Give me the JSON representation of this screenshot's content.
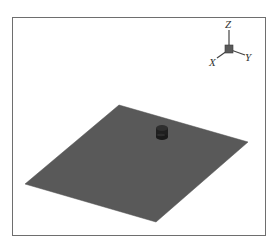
{
  "viewport": {
    "background": "#ffffff",
    "border_color": "#6e6e6e"
  },
  "scene": {
    "plane": {
      "color": "#595959",
      "vertices": {
        "top": [
          119,
          105
        ],
        "right": [
          248,
          142
        ],
        "bottom": [
          156,
          222
        ],
        "left": [
          25,
          184
        ]
      }
    },
    "cylinder": {
      "color": "#1f1f1f",
      "center": [
        162,
        133
      ]
    }
  },
  "axis_triad": {
    "labels": {
      "z": "Z",
      "y": "Y",
      "x": "X"
    },
    "cube_color": "#5a5a5a",
    "line_color": "#444444"
  }
}
